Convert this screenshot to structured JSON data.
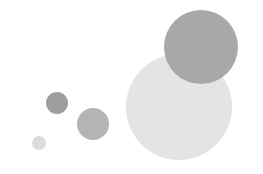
{
  "canvas": {
    "width": 263,
    "height": 174,
    "background_color": "#ffffff"
  },
  "chart_data": {
    "type": "scatter",
    "subtype": "bubble",
    "title": "",
    "subtitle": "",
    "xlabel": "",
    "ylabel": "",
    "xlim": [
      0,
      263
    ],
    "ylim": [
      0,
      174
    ],
    "grid": false,
    "axes_visible": false,
    "tick_labels_visible": false,
    "legend": false,
    "legend_position": "none",
    "annotations": [],
    "note": "Five filled grayscale circles on a plain white field; no axes, ticks, labels, legend or gridlines are rendered. Coordinates are in pixel space with y measured downward from the top-left corner.",
    "size_encoding": "radius",
    "point_count": 5,
    "draw_order": [
      "bubble-1",
      "bubble-2",
      "bubble-3",
      "bubble-4",
      "bubble-5"
    ],
    "points": [
      {
        "id": "bubble-1",
        "label": "smallest-bubble",
        "cx": 39,
        "cy": 143,
        "r": 7,
        "diameter": 14,
        "color": "#dcdcdc",
        "opacity": 1
      },
      {
        "id": "bubble-2",
        "label": "small-dark-bubble",
        "cx": 57,
        "cy": 103,
        "r": 11,
        "diameter": 22,
        "color": "#9e9e9e",
        "opacity": 1
      },
      {
        "id": "bubble-3",
        "label": "medium-bubble",
        "cx": 93,
        "cy": 124,
        "r": 16,
        "diameter": 32,
        "color": "#b4b4b4",
        "opacity": 1
      },
      {
        "id": "bubble-4",
        "label": "largest-pale-bubble",
        "cx": 179,
        "cy": 107,
        "r": 53,
        "diameter": 106,
        "color": "#e4e4e4",
        "opacity": 1
      },
      {
        "id": "bubble-5",
        "label": "large-dark-bubble",
        "cx": 201,
        "cy": 47,
        "r": 37,
        "diameter": 74,
        "color": "#a8a8a8",
        "opacity": 1
      }
    ],
    "x": [
      39,
      57,
      93,
      179,
      201
    ],
    "y": [
      143,
      103,
      124,
      107,
      47
    ],
    "sizes": [
      7,
      11,
      16,
      53,
      37
    ],
    "colors": [
      "#dcdcdc",
      "#9e9e9e",
      "#b4b4b4",
      "#e4e4e4",
      "#a8a8a8"
    ]
  }
}
